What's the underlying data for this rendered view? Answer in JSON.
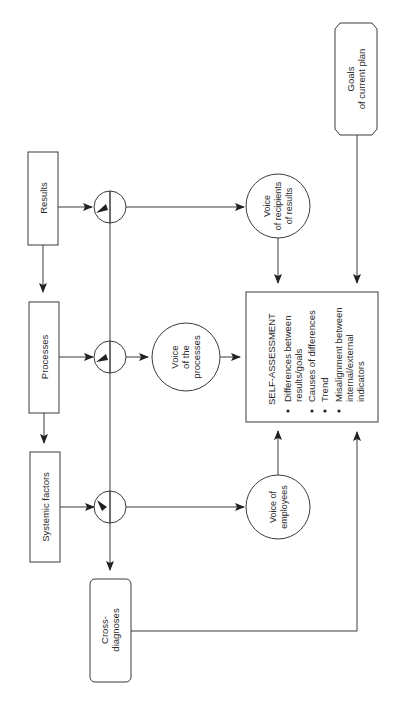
{
  "diagram": {
    "orientation": "rotated-90-ccw",
    "nodes": {
      "results": {
        "label": "Results"
      },
      "processes": {
        "label": "Processes"
      },
      "systemic_factors": {
        "label": "Systemic factors"
      },
      "cross_diagnoses": {
        "line1": "Cross-",
        "line2": "diagnoses"
      },
      "goals": {
        "line1": "Goals",
        "line2": "of current plan"
      },
      "voice_recipients": {
        "line1": "Voice",
        "line2": "of recipients",
        "line3": "of results"
      },
      "voice_processes": {
        "line1": "Voice",
        "line2": "of the",
        "line3": "processes"
      },
      "voice_employees": {
        "line1": "Voice of",
        "line2": "employees"
      },
      "self_assessment": {
        "title": "SELF-ASSESSMENT",
        "bullets": [
          {
            "line1": "Differences between",
            "line2": "results/goals"
          },
          {
            "line1": "Causes of differences"
          },
          {
            "line1": "Trend"
          },
          {
            "line1": "Misalignment between",
            "line2": "internal/external",
            "line3": "indicators"
          }
        ]
      }
    },
    "edges": [
      {
        "from": "results",
        "to": "processes"
      },
      {
        "from": "processes",
        "to": "systemic_factors"
      },
      {
        "from": "results",
        "to": "measure-node-1"
      },
      {
        "from": "processes",
        "to": "measure-node-2"
      },
      {
        "from": "systemic_factors",
        "to": "measure-node-3"
      },
      {
        "from": "measure-node-1",
        "to": "voice_recipients"
      },
      {
        "from": "measure-node-2",
        "to": "voice_processes"
      },
      {
        "from": "measure-node-3",
        "to": "voice_employees"
      },
      {
        "from": "measure-nodes",
        "to": "cross_diagnoses"
      },
      {
        "from": "voice_recipients",
        "to": "self_assessment"
      },
      {
        "from": "voice_processes",
        "to": "self_assessment"
      },
      {
        "from": "voice_employees",
        "to": "self_assessment"
      },
      {
        "from": "goals",
        "to": "self_assessment"
      },
      {
        "from": "cross_diagnoses",
        "to": "self_assessment"
      }
    ],
    "colors": {
      "stroke": "#3a3a3a",
      "text": "#2a2a2a",
      "background": "#ffffff"
    }
  }
}
